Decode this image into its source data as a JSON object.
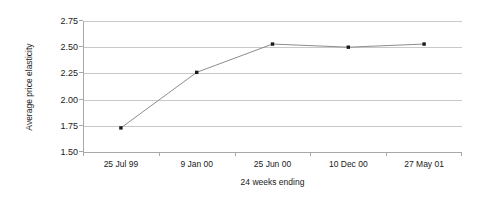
{
  "chart_data": {
    "type": "line",
    "title": "",
    "xlabel": "24 weeks ending",
    "ylabel": "Average price elasticity",
    "categories": [
      "25 Jul 99",
      "9 Jan 00",
      "25 Jun 00",
      "10 Dec 00",
      "27 May 01"
    ],
    "values": [
      1.73,
      2.26,
      2.53,
      2.5,
      2.53
    ],
    "series": [
      {
        "name": "Average price elasticity",
        "values": [
          1.73,
          2.26,
          2.53,
          2.5,
          2.53
        ]
      }
    ],
    "ylim": [
      1.5,
      2.75
    ],
    "yticks": [
      "1.50",
      "1.75",
      "2.00",
      "2.25",
      "2.50",
      "2.75"
    ],
    "ytick_values": [
      1.5,
      1.75,
      2.0,
      2.25,
      2.5,
      2.75
    ],
    "grid": true,
    "legend": "none",
    "marker": "square",
    "marker_color": "#1a1a1a",
    "line_color": "#808080",
    "gridline_color": "#c9c9c9",
    "axis_color": "#a8a8a8",
    "background_color": "#ffffff"
  }
}
